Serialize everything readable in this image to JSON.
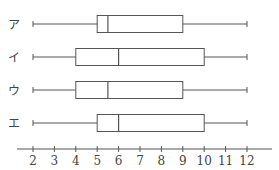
{
  "chart_data": {
    "type": "boxplot",
    "title": "",
    "xlabel": "",
    "ylabel": "",
    "xlim": [
      2,
      12
    ],
    "x_ticks": [
      2,
      3,
      4,
      5,
      6,
      7,
      8,
      9,
      10,
      11,
      12
    ],
    "grid": false,
    "series": [
      {
        "name": "ア",
        "min": 2,
        "q1": 5,
        "median": 5.5,
        "q3": 9,
        "max": 12
      },
      {
        "name": "イ",
        "min": 2,
        "q1": 4,
        "median": 6,
        "q3": 10,
        "max": 12
      },
      {
        "name": "ウ",
        "min": 2,
        "q1": 4,
        "median": 5.5,
        "q3": 9,
        "max": 12
      },
      {
        "name": "エ",
        "min": 2,
        "q1": 5,
        "median": 6,
        "q3": 10,
        "max": 12
      }
    ]
  },
  "colors": {
    "line": "#555555",
    "text": "#444444"
  }
}
